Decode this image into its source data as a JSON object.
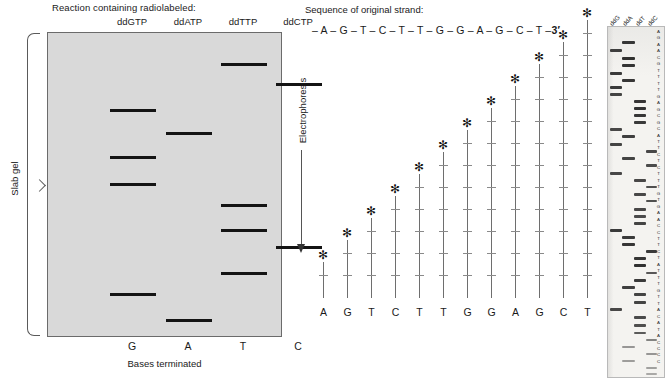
{
  "gel": {
    "header": "Reaction containing radiolabeled:",
    "slab_label": "Slab gel",
    "electrophoresis_label": "Electrophoresis",
    "bases_terminated_label": "Bases terminated",
    "lanes": [
      {
        "reagent": "ddGTP",
        "base": "G",
        "x_center": 85,
        "bands_y": [
          108,
          155,
          182,
          292
        ]
      },
      {
        "reagent": "ddATP",
        "base": "A",
        "x_center": 141,
        "bands_y": [
          131,
          318
        ]
      },
      {
        "reagent": "ddTTP",
        "base": "T",
        "x_center": 196,
        "bands_y": [
          62,
          203,
          228,
          271
        ]
      },
      {
        "reagent": "ddCTP",
        "base": "C",
        "x_center": 251,
        "bands_y": [
          82,
          245
        ]
      }
    ],
    "band_width": 46,
    "gel_bg_color": "#d9d9d9",
    "band_color": "#141414"
  },
  "ladder": {
    "sequence_title": "Sequence of original strand:",
    "strand": "– A – G – T – C – T – T – G – G – A – G – C – T –",
    "strand_end": "3′",
    "star_glyph": "✻",
    "bases": [
      "A",
      "G",
      "T",
      "C",
      "T",
      "T",
      "G",
      "G",
      "A",
      "G",
      "C",
      "T"
    ],
    "heights": [
      36,
      58,
      80,
      102,
      124,
      146,
      168,
      190,
      212,
      234,
      256,
      278
    ],
    "x_positions": [
      18,
      42,
      66,
      90,
      114,
      138,
      162,
      186,
      210,
      234,
      258,
      282
    ]
  },
  "autoradiograph": {
    "lane_labels": [
      "ddG",
      "ddA",
      "ddT",
      "ddC"
    ],
    "lane_label_x": [
      6,
      19,
      32,
      44
    ],
    "called_sequence": "AGAACGTTTTGAGCGCATTCTCTTTGTGAACCTTCTATTTGTTACATACCCC",
    "bands": [
      {
        "lane": 1,
        "y": 14,
        "w": 13,
        "h": 3.0,
        "o": 0.92
      },
      {
        "lane": 0,
        "y": 22,
        "w": 12,
        "h": 2.6,
        "o": 0.88
      },
      {
        "lane": 1,
        "y": 30,
        "w": 13,
        "h": 3.2,
        "o": 0.95
      },
      {
        "lane": 1,
        "y": 37,
        "w": 13,
        "h": 3.0,
        "o": 0.93
      },
      {
        "lane": 0,
        "y": 45,
        "w": 12,
        "h": 2.8,
        "o": 0.9
      },
      {
        "lane": 1,
        "y": 52,
        "w": 13,
        "h": 3.0,
        "o": 0.92
      },
      {
        "lane": 0,
        "y": 59,
        "w": 12,
        "h": 2.8,
        "o": 0.9
      },
      {
        "lane": 0,
        "y": 66,
        "w": 12,
        "h": 2.6,
        "o": 0.86
      },
      {
        "lane": 2,
        "y": 73,
        "w": 12,
        "h": 3.0,
        "o": 0.92
      },
      {
        "lane": 2,
        "y": 80,
        "w": 12,
        "h": 3.2,
        "o": 0.94
      },
      {
        "lane": 2,
        "y": 87,
        "w": 12,
        "h": 3.0,
        "o": 0.92
      },
      {
        "lane": 2,
        "y": 94,
        "w": 12,
        "h": 2.8,
        "o": 0.9
      },
      {
        "lane": 0,
        "y": 101,
        "w": 12,
        "h": 2.6,
        "o": 0.84
      },
      {
        "lane": 1,
        "y": 108,
        "w": 13,
        "h": 2.8,
        "o": 0.88
      },
      {
        "lane": 0,
        "y": 116,
        "w": 12,
        "h": 2.6,
        "o": 0.86
      },
      {
        "lane": 3,
        "y": 123,
        "w": 11,
        "h": 2.6,
        "o": 0.84
      },
      {
        "lane": 1,
        "y": 130,
        "w": 13,
        "h": 2.6,
        "o": 0.86
      },
      {
        "lane": 3,
        "y": 137,
        "w": 11,
        "h": 2.6,
        "o": 0.82
      },
      {
        "lane": 0,
        "y": 145,
        "w": 12,
        "h": 2.6,
        "o": 0.84
      },
      {
        "lane": 2,
        "y": 152,
        "w": 12,
        "h": 2.6,
        "o": 0.84
      },
      {
        "lane": 3,
        "y": 159,
        "w": 11,
        "h": 2.4,
        "o": 0.8
      },
      {
        "lane": 2,
        "y": 166,
        "w": 12,
        "h": 2.6,
        "o": 0.84
      },
      {
        "lane": 3,
        "y": 173,
        "w": 11,
        "h": 2.4,
        "o": 0.8
      },
      {
        "lane": 2,
        "y": 181,
        "w": 12,
        "h": 2.6,
        "o": 0.84
      },
      {
        "lane": 2,
        "y": 188,
        "w": 12,
        "h": 2.6,
        "o": 0.82
      },
      {
        "lane": 2,
        "y": 195,
        "w": 12,
        "h": 2.8,
        "o": 0.86
      },
      {
        "lane": 0,
        "y": 202,
        "w": 12,
        "h": 3.0,
        "o": 0.9
      },
      {
        "lane": 1,
        "y": 209,
        "w": 13,
        "h": 3.0,
        "o": 0.9
      },
      {
        "lane": 1,
        "y": 216,
        "w": 13,
        "h": 3.2,
        "o": 0.92
      },
      {
        "lane": 3,
        "y": 223,
        "w": 11,
        "h": 3.0,
        "o": 0.9
      },
      {
        "lane": 2,
        "y": 230,
        "w": 12,
        "h": 3.2,
        "o": 0.93
      },
      {
        "lane": 2,
        "y": 237,
        "w": 12,
        "h": 3.4,
        "o": 0.95
      },
      {
        "lane": 3,
        "y": 245,
        "w": 11,
        "h": 2.4,
        "o": 0.76
      },
      {
        "lane": 2,
        "y": 252,
        "w": 12,
        "h": 3.0,
        "o": 0.9
      },
      {
        "lane": 1,
        "y": 259,
        "w": 13,
        "h": 2.8,
        "o": 0.88
      },
      {
        "lane": 2,
        "y": 266,
        "w": 12,
        "h": 2.8,
        "o": 0.86
      },
      {
        "lane": 2,
        "y": 274,
        "w": 12,
        "h": 2.8,
        "o": 0.86
      },
      {
        "lane": 0,
        "y": 281,
        "w": 12,
        "h": 2.6,
        "o": 0.84
      },
      {
        "lane": 2,
        "y": 289,
        "w": 12,
        "h": 2.6,
        "o": 0.82
      },
      {
        "lane": 2,
        "y": 297,
        "w": 12,
        "h": 2.6,
        "o": 0.8
      },
      {
        "lane": 2,
        "y": 305,
        "w": 12,
        "h": 2.4,
        "o": 0.74
      },
      {
        "lane": 3,
        "y": 312,
        "w": 11,
        "h": 2.0,
        "o": 0.55
      },
      {
        "lane": 1,
        "y": 319,
        "w": 13,
        "h": 1.8,
        "o": 0.45
      },
      {
        "lane": 3,
        "y": 326,
        "w": 11,
        "h": 1.8,
        "o": 0.45
      },
      {
        "lane": 1,
        "y": 333,
        "w": 13,
        "h": 1.8,
        "o": 0.42
      },
      {
        "lane": 3,
        "y": 340,
        "w": 11,
        "h": 1.8,
        "o": 0.4
      },
      {
        "lane": 3,
        "y": 346,
        "w": 11,
        "h": 1.6,
        "o": 0.36
      }
    ]
  }
}
